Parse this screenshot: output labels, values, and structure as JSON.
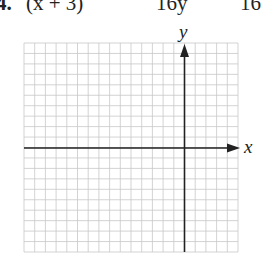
{
  "problem": {
    "number_label": "4.",
    "expression_left": "(x + 3)",
    "expression_mid": "16y",
    "expression_right": "16"
  },
  "graph": {
    "x_axis_label": "x",
    "y_axis_label": "y",
    "grid": {
      "columns": 20,
      "rows": 20,
      "origin_column": 15,
      "origin_row": 10
    },
    "colors": {
      "grid_line": "#c8c8c8",
      "axis": "#222222"
    }
  }
}
